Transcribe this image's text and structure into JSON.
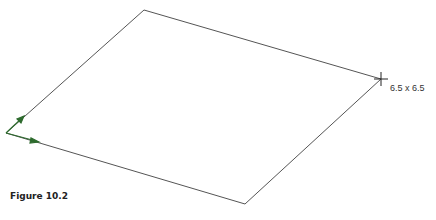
{
  "figure": {
    "caption": "Figure 10.2",
    "dimension_label": "6.5 x 6.5"
  },
  "shape": {
    "type": "plane",
    "corners": {
      "top": [
        144,
        10
      ],
      "right": [
        381,
        79
      ],
      "bottom": [
        245,
        204
      ],
      "left": [
        6,
        133
      ]
    },
    "stroke_color": "#555555",
    "axis_color": "#2e6b2e"
  }
}
